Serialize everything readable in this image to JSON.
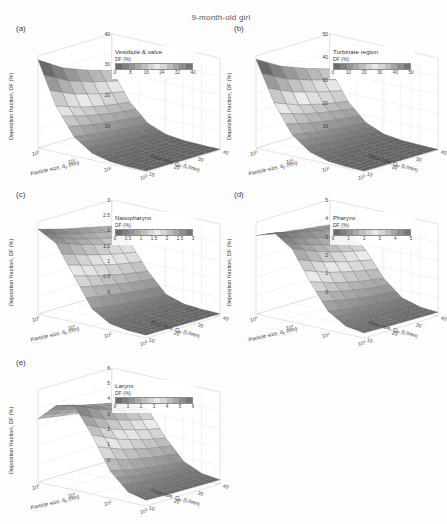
{
  "figure": {
    "title": "9-month-old girl",
    "axis": {
      "ylabel": "Deposition fraction, DF (%)",
      "xlabel_prefix": "Particle size, d",
      "xlabel_sub": "p",
      "xlabel_suffix": " (nm)",
      "zlabel_prefix": "Flow rate, Q",
      "zlabel_sub": "in",
      "zlabel_suffix": " (L/min)",
      "xticks": [
        "10",
        "10",
        "10",
        "10"
      ],
      "xtick_exponents": [
        "0",
        "1",
        "2",
        "3"
      ],
      "zticks": [
        "40",
        "30",
        "20",
        "10"
      ]
    },
    "legend_unit": "DF (%)"
  },
  "panels": [
    {
      "tag": "(a)",
      "region": "Vestibule & valve",
      "yticks": [
        "40",
        "30",
        "20",
        "10"
      ],
      "ymax": 48,
      "cbar_ticks": [
        "0",
        "8",
        "16",
        "24",
        "32",
        "40"
      ],
      "cbar_range": [
        0,
        40
      ]
    },
    {
      "tag": "(b)",
      "region": "Turbinate region",
      "yticks": [
        "50",
        "40",
        "30",
        "20",
        "10"
      ],
      "ymax": 58,
      "cbar_ticks": [
        "0",
        "10",
        "20",
        "30",
        "40",
        "50"
      ],
      "cbar_range": [
        0,
        50
      ]
    },
    {
      "tag": "(c)",
      "region": "Nasopharynx",
      "yticks": [
        "3",
        "2.5",
        "2",
        "1.5",
        "1",
        "0.5",
        "0"
      ],
      "ymax": 3.2,
      "cbar_ticks": [
        "0",
        "0.5",
        "1",
        "1.5",
        "2",
        "2.5",
        "3"
      ],
      "cbar_range": [
        0,
        3
      ]
    },
    {
      "tag": "(d)",
      "region": "Pharynx",
      "yticks": [
        "5",
        "4",
        "3",
        "2",
        "1",
        "0"
      ],
      "ymax": 5.4,
      "cbar_ticks": [
        "0",
        "1",
        "2",
        "3",
        "4",
        "5"
      ],
      "cbar_range": [
        0,
        5
      ]
    },
    {
      "tag": "(e)",
      "region": "Larynx",
      "yticks": [
        "6",
        "5",
        "4",
        "3",
        "2",
        "1",
        "0"
      ],
      "ymax": 6.4,
      "cbar_ticks": [
        "0",
        "1",
        "2",
        "3",
        "4",
        "5",
        "6"
      ],
      "cbar_range": [
        0,
        6
      ]
    }
  ],
  "chart_data": {
    "type": "surface",
    "title": "9-month-old girl",
    "xlabel": "Particle size, dp (nm)",
    "ylabel": "Deposition fraction, DF (%)",
    "zlabel": "Flow rate, Qin (L/min)",
    "xlim": [
      1,
      1000
    ],
    "xscale": "log",
    "zlim": [
      10,
      40
    ],
    "grid": true,
    "legend_position": "inside-upper-right",
    "colormap": "grayscale-banded",
    "x": [
      1,
      3.16,
      10,
      31.6,
      100,
      316,
      1000
    ],
    "z": [
      10,
      20,
      30,
      40
    ],
    "surfaces": [
      {
        "name": "Vestibule & valve",
        "panel": "(a)",
        "zlim": [
          0,
          48
        ],
        "values": [
          [
            46.0,
            24.0,
            10.0,
            3.6,
            1.3,
            0.7,
            0.5
          ],
          [
            38.0,
            19.5,
            8.0,
            2.8,
            1.0,
            0.6,
            0.5
          ],
          [
            33.0,
            16.5,
            6.6,
            2.2,
            0.9,
            0.5,
            0.4
          ],
          [
            29.0,
            14.5,
            5.6,
            1.9,
            0.8,
            0.5,
            0.4
          ]
        ]
      },
      {
        "name": "Turbinate region",
        "panel": "(b)",
        "zlim": [
          0,
          58
        ],
        "values": [
          [
            56.0,
            31.0,
            13.5,
            5.0,
            1.8,
            0.9,
            0.6
          ],
          [
            47.0,
            25.0,
            10.5,
            3.8,
            1.4,
            0.8,
            0.5
          ],
          [
            41.0,
            21.0,
            8.6,
            3.0,
            1.1,
            0.7,
            0.5
          ],
          [
            36.0,
            18.0,
            7.2,
            2.5,
            1.0,
            0.6,
            0.4
          ]
        ]
      },
      {
        "name": "Nasopharynx",
        "panel": "(c)",
        "zlim": [
          0,
          3.2
        ],
        "values": [
          [
            2.95,
            2.6,
            1.6,
            0.6,
            0.22,
            0.12,
            0.1
          ],
          [
            2.7,
            2.3,
            1.35,
            0.48,
            0.18,
            0.11,
            0.09
          ],
          [
            2.5,
            2.05,
            1.15,
            0.4,
            0.16,
            0.1,
            0.08
          ],
          [
            2.3,
            1.85,
            1.0,
            0.34,
            0.14,
            0.09,
            0.08
          ]
        ]
      },
      {
        "name": "Pharynx",
        "panel": "(d)",
        "zlim": [
          0,
          5.4
        ],
        "values": [
          [
            4.6,
            5.0,
            4.3,
            2.6,
            1.1,
            0.45,
            0.3
          ],
          [
            4.35,
            4.6,
            3.7,
            2.1,
            0.85,
            0.38,
            0.26
          ],
          [
            4.15,
            4.25,
            3.25,
            1.75,
            0.7,
            0.33,
            0.24
          ],
          [
            3.95,
            3.95,
            2.9,
            1.5,
            0.6,
            0.3,
            0.22
          ]
        ]
      },
      {
        "name": "Larynx",
        "panel": "(e)",
        "zlim": [
          0,
          6.4
        ],
        "values": [
          [
            4.4,
            5.6,
            5.9,
            4.1,
            1.9,
            0.7,
            0.4
          ],
          [
            4.1,
            5.1,
            5.1,
            3.3,
            1.45,
            0.58,
            0.35
          ],
          [
            3.85,
            4.7,
            4.5,
            2.75,
            1.2,
            0.5,
            0.32
          ],
          [
            3.6,
            4.35,
            4.05,
            2.35,
            1.0,
            0.45,
            0.3
          ]
        ]
      }
    ]
  }
}
